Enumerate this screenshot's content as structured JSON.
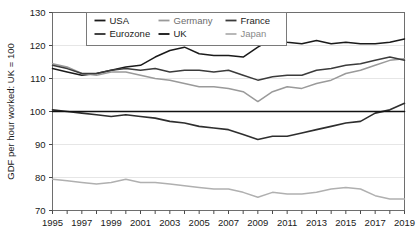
{
  "chart_data": {
    "type": "line",
    "title": "",
    "xlabel": "",
    "ylabel": "GDF per hour worked: UK = 100",
    "xlim": [
      1995,
      2019
    ],
    "ylim": [
      70,
      130
    ],
    "yticks": [
      70,
      80,
      90,
      100,
      110,
      120,
      130
    ],
    "xticks": [
      1995,
      1997,
      1999,
      2001,
      2003,
      2005,
      2007,
      2009,
      2011,
      2013,
      2015,
      2017,
      2019
    ],
    "x_tick_labels": [
      "1995",
      "1997",
      "1999",
      "2001",
      "2003",
      "2005",
      "2007",
      "2009",
      "2011",
      "2013",
      "2015",
      "2017",
      "2019"
    ],
    "y_tick_labels": [
      "70",
      "80",
      "90",
      "100",
      "110",
      "120",
      "130"
    ],
    "x": [
      1995,
      1996,
      1997,
      1998,
      1999,
      2000,
      2001,
      2002,
      2003,
      2004,
      2005,
      2006,
      2007,
      2008,
      2009,
      2010,
      2011,
      2012,
      2013,
      2014,
      2015,
      2016,
      2017,
      2018,
      2019
    ],
    "grid": "horizontal",
    "legend_position": "top-center",
    "series": [
      {
        "name": "USA",
        "color": "#1a1a1a",
        "width": 1.5,
        "values": [
          113.0,
          112.0,
          111.0,
          111.5,
          112.5,
          113.5,
          114.0,
          116.5,
          118.5,
          119.5,
          117.5,
          117.0,
          117.0,
          116.5,
          119.5,
          122.0,
          121.0,
          120.5,
          121.5,
          120.5,
          121.0,
          120.5,
          120.5,
          121.0,
          122.0
        ]
      },
      {
        "name": "Germany",
        "color": "#9a9a9a",
        "width": 1.5,
        "values": [
          114.5,
          113.5,
          111.5,
          111.0,
          112.0,
          112.0,
          111.0,
          110.0,
          109.5,
          108.5,
          107.5,
          107.5,
          107.0,
          106.0,
          103.0,
          106.0,
          107.5,
          107.0,
          108.5,
          109.5,
          111.5,
          112.5,
          114.0,
          115.5,
          116.0
        ]
      },
      {
        "name": "France",
        "color": "#3b3b3b",
        "width": 1.5,
        "values": [
          114.0,
          113.0,
          111.5,
          111.5,
          112.5,
          113.0,
          112.5,
          113.0,
          112.0,
          112.5,
          112.5,
          112.0,
          112.5,
          111.0,
          109.5,
          110.5,
          111.0,
          111.0,
          112.5,
          113.0,
          114.0,
          114.5,
          115.5,
          116.5,
          115.5
        ]
      },
      {
        "name": "Eurozone",
        "color": "#2e2e2e",
        "width": 1.6,
        "values": [
          100.5,
          100.0,
          99.5,
          99.0,
          98.5,
          99.0,
          98.5,
          98.0,
          97.0,
          96.5,
          95.5,
          95.0,
          94.5,
          93.0,
          91.5,
          92.5,
          92.5,
          93.5,
          94.5,
          95.5,
          96.5,
          97.0,
          99.5,
          100.5,
          102.5
        ]
      },
      {
        "name": "UK",
        "color": "#111111",
        "width": 1.6,
        "values": [
          100,
          100,
          100,
          100,
          100,
          100,
          100,
          100,
          100,
          100,
          100,
          100,
          100,
          100,
          100,
          100,
          100,
          100,
          100,
          100,
          100,
          100,
          100,
          100,
          100
        ]
      },
      {
        "name": "Japan",
        "color": "#b0b0b0",
        "width": 1.5,
        "values": [
          79.5,
          79.0,
          78.5,
          78.0,
          78.5,
          79.5,
          78.5,
          78.5,
          78.0,
          77.5,
          77.0,
          76.5,
          76.5,
          75.5,
          74.0,
          75.5,
          75.0,
          75.0,
          75.5,
          76.5,
          77.0,
          76.5,
          74.5,
          73.5,
          73.5
        ]
      }
    ]
  },
  "legend": {
    "rows": [
      [
        {
          "label": "USA",
          "color": "#1a1a1a"
        },
        {
          "label": "Germany",
          "color": "#9a9a9a"
        },
        {
          "label": "France",
          "color": "#3b3b3b"
        }
      ],
      [
        {
          "label": "Eurozone",
          "color": "#2e2e2e"
        },
        {
          "label": "UK",
          "color": "#111111"
        },
        {
          "label": "Japan",
          "color": "#b0b0b0"
        }
      ]
    ]
  }
}
